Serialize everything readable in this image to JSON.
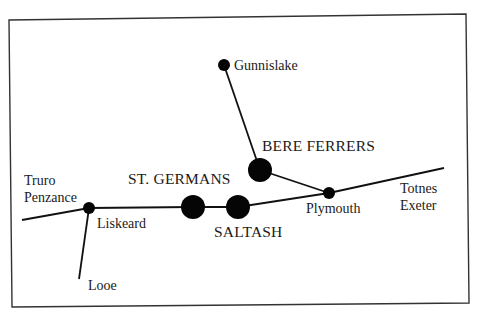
{
  "diagram": {
    "title": "",
    "frame": {
      "points": [
        [
          9,
          20
        ],
        [
          466,
          14
        ],
        [
          469,
          303
        ],
        [
          12,
          307
        ]
      ]
    },
    "stations": [
      {
        "id": "gunnislake",
        "label": "Gunnislake",
        "x": 224,
        "y": 65,
        "r": 6,
        "size": "small",
        "label_x": 234,
        "label_y": 70
      },
      {
        "id": "bere-ferrers",
        "label": "BERE FERRERS",
        "x": 260,
        "y": 170,
        "r": 12,
        "size": "large",
        "label_x": 262,
        "label_y": 151
      },
      {
        "id": "liskeard",
        "label": "Liskeard",
        "x": 89,
        "y": 208,
        "r": 6,
        "size": "small",
        "label_x": 97,
        "label_y": 228
      },
      {
        "id": "st-germans",
        "label": "ST. GERMANS",
        "x": 193,
        "y": 207,
        "r": 12,
        "size": "large",
        "label_x": 128,
        "label_y": 184
      },
      {
        "id": "saltash",
        "label": "SALTASH",
        "x": 238,
        "y": 207,
        "r": 12,
        "size": "large",
        "label_x": 214,
        "label_y": 237
      },
      {
        "id": "plymouth",
        "label": "Plymouth",
        "x": 329,
        "y": 193,
        "r": 6,
        "size": "small",
        "label_x": 306,
        "label_y": 213
      }
    ],
    "endpoints": [
      {
        "id": "truro-penzance",
        "lines": [
          "Truro",
          "Penzance"
        ],
        "label_x": 24,
        "label_y": 185,
        "line_gap": 17
      },
      {
        "id": "looe",
        "lines": [
          "Looe"
        ],
        "label_x": 88,
        "label_y": 290,
        "line_gap": 0
      },
      {
        "id": "totnes-exeter",
        "lines": [
          "Totnes",
          "Exeter"
        ],
        "label_x": 400,
        "label_y": 193,
        "line_gap": 17
      }
    ],
    "routes": [
      {
        "id": "main-line-west",
        "from": [
          22,
          220
        ],
        "to": [
          89,
          208
        ]
      },
      {
        "id": "main-line-liskeard-stgermans",
        "from": [
          89,
          208
        ],
        "to": [
          193,
          207
        ]
      },
      {
        "id": "main-line-stgermans-saltash",
        "from": [
          193,
          207
        ],
        "to": [
          238,
          207
        ]
      },
      {
        "id": "main-line-saltash-plymouth",
        "from": [
          238,
          207
        ],
        "to": [
          329,
          193
        ]
      },
      {
        "id": "main-line-east",
        "from": [
          329,
          193
        ],
        "to": [
          444,
          168
        ]
      },
      {
        "id": "looe-branch",
        "from": [
          89,
          208
        ],
        "to": [
          79,
          279
        ]
      },
      {
        "id": "tamar-valley-lower",
        "from": [
          260,
          170
        ],
        "to": [
          329,
          193
        ]
      },
      {
        "id": "tamar-valley-upper",
        "from": [
          224,
          65
        ],
        "to": [
          260,
          170
        ]
      }
    ]
  }
}
